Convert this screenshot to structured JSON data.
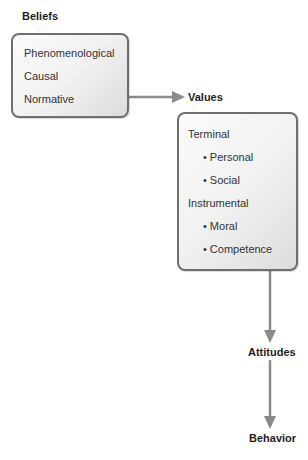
{
  "diagram": {
    "nodes": {
      "beliefs": {
        "label": "Beliefs",
        "items": [
          "Phenomenological",
          "Causal",
          "Normative"
        ]
      },
      "values": {
        "label": "Values",
        "groups": [
          {
            "label": "Terminal",
            "items": [
              "Personal",
              "Social"
            ]
          },
          {
            "label": "Instrumental",
            "items": [
              "Moral",
              "Competence"
            ]
          }
        ]
      },
      "attitudes": {
        "label": "Attitudes"
      },
      "behavior": {
        "label": "Behavior"
      }
    },
    "edges": [
      {
        "from": "beliefs",
        "to": "values"
      },
      {
        "from": "values",
        "to": "attitudes"
      },
      {
        "from": "attitudes",
        "to": "behavior"
      }
    ],
    "bullet_glyph": "•",
    "colors": {
      "box_border": "#6f6f6f",
      "arrow": "#8a8a8a",
      "text": "#2a2a2a"
    }
  }
}
